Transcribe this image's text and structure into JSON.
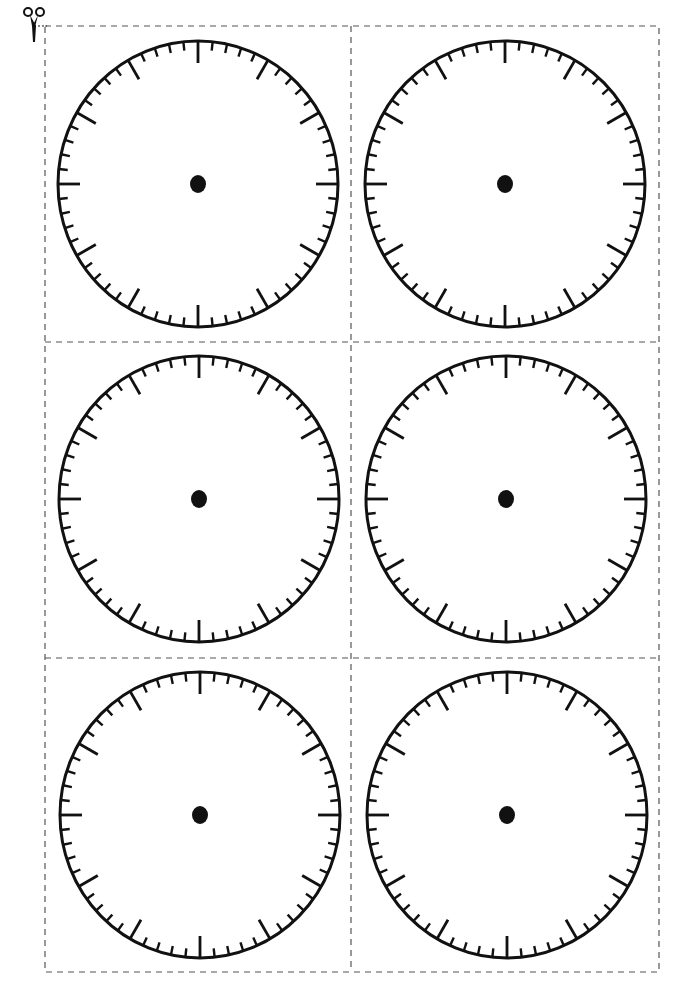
{
  "page": {
    "background": "#ffffff",
    "ink_color": "#111111",
    "cut_line_color": "#555555"
  },
  "cut_guide": {
    "icon": "scissors-icon",
    "border": {
      "left": 45,
      "top": 26,
      "right": 659,
      "bottom": 972
    },
    "vertical_divider_x": 351,
    "horizontal_divider_y": [
      342,
      658
    ],
    "dash_pattern": "6 5"
  },
  "clock_style": {
    "rx": 140,
    "ry": 143,
    "stroke_width": 3,
    "tick_count": 60,
    "major_every": 5,
    "major_tick_length": 22,
    "minor_tick_length": 9,
    "tick_width": 2.4,
    "major_tick_width": 2.8,
    "center_dot_rx": 8,
    "center_dot_ry": 9
  },
  "clocks": [
    {
      "id": "clock-1",
      "row": 1,
      "col": 1,
      "cx": 198,
      "cy": 184,
      "numbers": []
    },
    {
      "id": "clock-2",
      "row": 1,
      "col": 2,
      "cx": 505,
      "cy": 184,
      "numbers": []
    },
    {
      "id": "clock-3",
      "row": 2,
      "col": 1,
      "cx": 199,
      "cy": 499,
      "numbers": []
    },
    {
      "id": "clock-4",
      "row": 2,
      "col": 2,
      "cx": 506,
      "cy": 499,
      "numbers": []
    },
    {
      "id": "clock-5",
      "row": 3,
      "col": 1,
      "cx": 200,
      "cy": 815,
      "numbers": []
    },
    {
      "id": "clock-6",
      "row": 3,
      "col": 2,
      "cx": 507,
      "cy": 815,
      "numbers": []
    }
  ]
}
